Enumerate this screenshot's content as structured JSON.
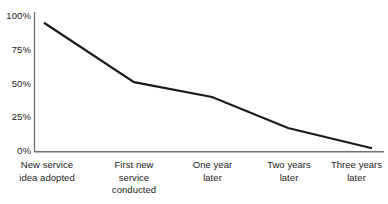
{
  "chart_data": {
    "type": "line",
    "title": "",
    "subtitle": "",
    "xlabel": "",
    "ylabel": "",
    "categories": [
      "New service\nidea adopted",
      "First new\nservice\nconducted",
      "One year\nlater",
      "Two years\nlater",
      "Three years\nlater"
    ],
    "values": [
      95,
      51,
      40,
      17,
      2
    ],
    "series": [
      {
        "name": "Share of new service ideas surviving",
        "values": [
          95,
          51,
          40,
          17,
          2
        ]
      }
    ],
    "ylim": [
      0,
      100
    ],
    "ytick_values": [
      100,
      75,
      50,
      25,
      0
    ],
    "ytick_labels": [
      "100%",
      "75%",
      "50%",
      "25%",
      "0%"
    ],
    "grid": false,
    "legend": "none",
    "line_color": "#1a1a1a",
    "axis_color": "#6f6f6f",
    "background_color": "#ffffff",
    "annotations": []
  },
  "axis": {
    "y_labels": [
      "100%",
      "75%",
      "50%",
      "25%",
      "0%"
    ],
    "x_labels": [
      "New service\nidea adopted",
      "First new\nservice\nconducted",
      "One year\nlater",
      "Two years\nlater",
      "Three years\nlater"
    ]
  }
}
